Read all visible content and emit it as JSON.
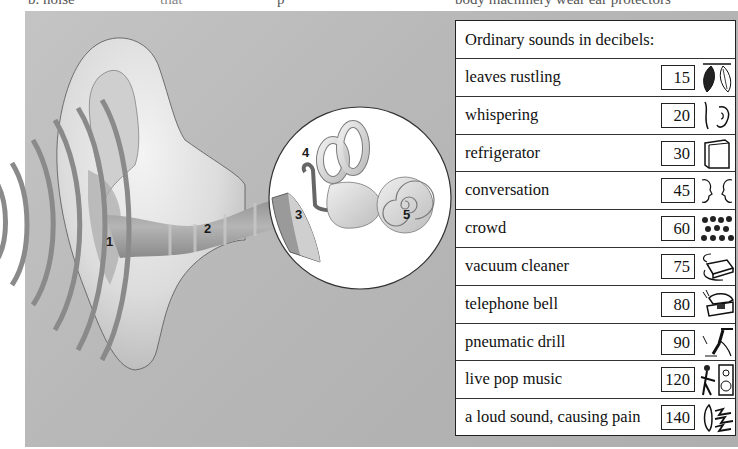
{
  "top_text_fragments": [
    "b. noise",
    "that",
    "p",
    "body machinery wear ear protectors"
  ],
  "diagram": {
    "labels": [
      {
        "id": "1",
        "text": "1",
        "x": 106,
        "y": 234
      },
      {
        "id": "2",
        "text": "2",
        "x": 204,
        "y": 221
      },
      {
        "id": "3",
        "text": "3",
        "x": 295,
        "y": 207
      },
      {
        "id": "4",
        "text": "4",
        "x": 302,
        "y": 145
      },
      {
        "id": "5",
        "text": "5",
        "x": 403,
        "y": 207
      }
    ],
    "panel_color": "#b9b9b9",
    "sound_wave_color": "#8a8a8a"
  },
  "table": {
    "title": "Ordinary sounds in decibels:",
    "rows": [
      {
        "label": "leaves rustling",
        "decibels": "15",
        "icon": "leaves-icon"
      },
      {
        "label": "whispering",
        "decibels": "20",
        "icon": "whisper-ear-icon"
      },
      {
        "label": "refrigerator",
        "decibels": "30",
        "icon": "refrigerator-icon"
      },
      {
        "label": "conversation",
        "decibels": "45",
        "icon": "conversation-faces-icon"
      },
      {
        "label": "crowd",
        "decibels": "60",
        "icon": "crowd-icon"
      },
      {
        "label": "vacuum cleaner",
        "decibels": "75",
        "icon": "vacuum-cleaner-icon"
      },
      {
        "label": "telephone bell",
        "decibels": "80",
        "icon": "telephone-icon"
      },
      {
        "label": "pneumatic drill",
        "decibels": "90",
        "icon": "pneumatic-drill-icon"
      },
      {
        "label": "live pop music",
        "decibels": "120",
        "icon": "speaker-guitarist-icon"
      },
      {
        "label": "a loud sound, causing pain",
        "decibels": "140",
        "icon": "pain-ear-icon"
      }
    ]
  }
}
